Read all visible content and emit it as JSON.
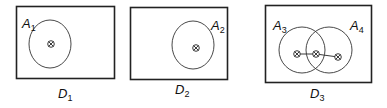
{
  "diagrams": [
    {
      "name": "D",
      "sub": "1",
      "regions": [
        {
          "name": "A",
          "sub": "1"
        }
      ]
    },
    {
      "name": "D",
      "sub": "2",
      "regions": [
        {
          "name": "A",
          "sub": "2"
        }
      ]
    },
    {
      "name": "D",
      "sub": "3",
      "regions": [
        {
          "name": "A",
          "sub": "3"
        },
        {
          "name": "A",
          "sub": "4"
        }
      ]
    }
  ],
  "colors": {
    "stroke": "#222222",
    "background": "#ffffff"
  }
}
